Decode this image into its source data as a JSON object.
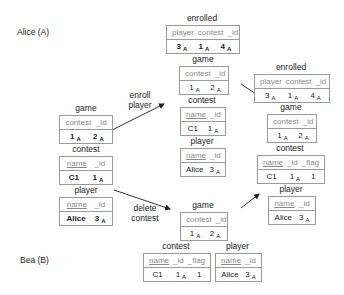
{
  "users": {
    "alice": "Alice (A)",
    "bea": "Bea (B)"
  },
  "actions": {
    "enroll_line1": "enroll",
    "enroll_line2": "player",
    "delete_line1": "delete",
    "delete_line2": "contest"
  },
  "initial_state": {
    "game": {
      "name": "game",
      "headers": [
        "contest",
        "_id"
      ],
      "row": [
        "1",
        "2"
      ],
      "subs": [
        "A",
        "A"
      ]
    },
    "contest": {
      "name": "contest",
      "headers": [
        "name",
        "_id"
      ],
      "row": [
        "C1",
        "1"
      ],
      "subs": [
        "",
        "A"
      ]
    },
    "player": {
      "name": "player",
      "headers": [
        "name",
        "_id"
      ],
      "row": [
        "Alice",
        "3"
      ],
      "subs": [
        "",
        "A"
      ]
    }
  },
  "alice_state": {
    "enrolled": {
      "name": "enrolled",
      "headers": [
        "player",
        "contest",
        "_id"
      ],
      "row": [
        "3",
        "1",
        "4"
      ],
      "subs": [
        "A",
        "A",
        "A"
      ]
    },
    "game": {
      "name": "game",
      "headers": [
        "contest",
        "_id"
      ],
      "row": [
        "1",
        "2"
      ],
      "subs": [
        "A",
        "A"
      ]
    },
    "contest": {
      "name": "contest",
      "headers": [
        "name",
        "_id"
      ],
      "row": [
        "C1",
        "1"
      ],
      "subs": [
        "",
        "A"
      ]
    },
    "player": {
      "name": "player",
      "headers": [
        "name",
        "_id"
      ],
      "row": [
        "Alice",
        "3"
      ],
      "subs": [
        "",
        "A"
      ]
    }
  },
  "bea_state": {
    "game": {
      "name": "game",
      "headers": [
        "contest",
        "_id"
      ],
      "row": [
        "1",
        "2"
      ],
      "subs": [
        "A",
        "A"
      ]
    },
    "contest": {
      "name": "contest",
      "headers": [
        "name",
        "_id",
        "_flag"
      ],
      "row": [
        "C1",
        "1",
        "1"
      ],
      "subs": [
        "",
        "A",
        ""
      ]
    },
    "player": {
      "name": "player",
      "headers": [
        "name",
        "_id"
      ],
      "row": [
        "Alice",
        "3"
      ],
      "subs": [
        "",
        "A"
      ]
    }
  },
  "merged_state": {
    "enrolled": {
      "name": "enrolled",
      "headers": [
        "player",
        "contest",
        "_id"
      ],
      "row": [
        "3",
        "1",
        "4"
      ],
      "subs": [
        "A",
        "A",
        "A"
      ]
    },
    "game": {
      "name": "game",
      "headers": [
        "contest",
        "_id"
      ],
      "row": [
        "1",
        "2"
      ],
      "subs": [
        "A",
        "A"
      ]
    },
    "contest": {
      "name": "contest",
      "headers": [
        "name",
        "_id",
        "_flag"
      ],
      "row": [
        "C1",
        "1",
        "1"
      ],
      "subs": [
        "",
        "A",
        ""
      ]
    },
    "player": {
      "name": "player",
      "headers": [
        "name",
        "_id"
      ],
      "row": [
        "Alice",
        "3"
      ],
      "subs": [
        "",
        "A"
      ]
    }
  }
}
